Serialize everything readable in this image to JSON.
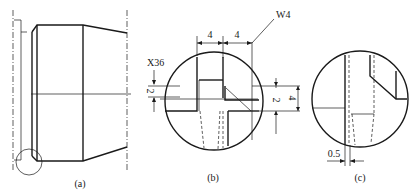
{
  "figure": {
    "panels": [
      {
        "id": "a",
        "label": "(a)",
        "description": "Stepped shaft outline with detail circle at lower-left chamfer/groove"
      },
      {
        "id": "b",
        "label": "(b)",
        "description": "Enlarged detail of groove with dimensions"
      },
      {
        "id": "c",
        "label": "(c)",
        "description": "Enlarged detail with 0.5 offset"
      }
    ],
    "dimensions": {
      "x36": "X36",
      "w4": "W4",
      "width1": "4",
      "width2": "4",
      "height_small_left": "2",
      "height_small_right": "2",
      "height_total": "4",
      "offset": "0.5"
    },
    "colors": {
      "line": "#1a1a1a",
      "background": "#ffffff"
    }
  }
}
